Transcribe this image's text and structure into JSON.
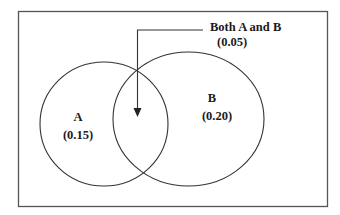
{
  "diagram": {
    "type": "venn",
    "callout": {
      "title": "Both A and B",
      "value": "(0.05)"
    },
    "sets": [
      {
        "name": "A",
        "value": "(0.15)"
      },
      {
        "name": "B",
        "value": "(0.20)"
      }
    ],
    "colors": {
      "stroke": "#333333",
      "frame": "#555555",
      "text": "#1a1a1a",
      "background": "#ffffff"
    }
  }
}
